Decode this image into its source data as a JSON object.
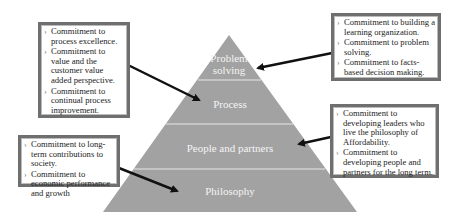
{
  "pyramid": {
    "fill": "#a0a0a0",
    "tiers": [
      {
        "label": "Problem solving",
        "line1": "Problem",
        "line2": "solving"
      },
      {
        "label": "Process"
      },
      {
        "label": "People and partners"
      },
      {
        "label": "Philosophy"
      }
    ]
  },
  "boxes": {
    "process": {
      "items": [
        "Commitment to process excellence.",
        "Commitment to value and the customer value added perspective.",
        "Commitment to continual process improvement."
      ]
    },
    "problem_solving": {
      "items": [
        "Commitment to building a learning organization.",
        "Commitment to problem solving.",
        "Commitment to facts-based decision making."
      ]
    },
    "people_partners": {
      "items": [
        "Commitment to developing leaders who live the philosophy of Affordability.",
        "Commitment to developing people and partners for the long term."
      ]
    },
    "philosophy": {
      "items": [
        "Commitment to long-term contributions to society.",
        "Commitment to economic performance and growth"
      ]
    }
  }
}
